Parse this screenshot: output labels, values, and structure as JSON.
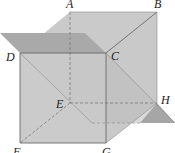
{
  "figure": {
    "type": "geometry-cube-with-planes"
  },
  "vertices": [
    {
      "id": "A",
      "label": "A",
      "x": 70,
      "y": 12,
      "lx": 66,
      "ly": 8
    },
    {
      "id": "B",
      "label": "B",
      "x": 157,
      "y": 12,
      "lx": 154,
      "ly": 8
    },
    {
      "id": "C",
      "label": "C",
      "x": 106,
      "y": 53,
      "lx": 112,
      "ly": 60
    },
    {
      "id": "D",
      "label": "D",
      "x": 20,
      "y": 53,
      "lx": 7,
      "ly": 61
    },
    {
      "id": "E",
      "label": "E",
      "x": 70,
      "y": 103,
      "lx": 55,
      "ly": 108
    },
    {
      "id": "F",
      "label": "F",
      "x": 20,
      "y": 143,
      "lx": 13,
      "ly": 156
    },
    {
      "id": "G",
      "label": "G",
      "x": 106,
      "y": 143,
      "lx": 102,
      "ly": 156
    },
    {
      "id": "H",
      "label": "H",
      "x": 157,
      "y": 103,
      "lx": 161,
      "ly": 103
    }
  ],
  "colors": {
    "face_light": "#d6d6d6",
    "face_mid": "#c4c4c4",
    "plane_dark": "#a8a8a8",
    "plane_diag": "#bdbdbd",
    "edge": "#6a6a6a",
    "hidden_edge": "#7a7a7a",
    "label": "#222222"
  }
}
